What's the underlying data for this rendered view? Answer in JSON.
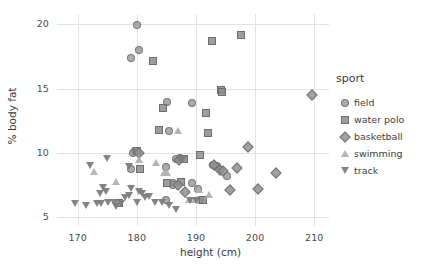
{
  "chart_data": {
    "type": "scatter",
    "title": "",
    "xlabel": "height (cm)",
    "ylabel": "% body fat",
    "xlim": [
      166.5,
      212.5
    ],
    "ylim": [
      4.3,
      20.8
    ],
    "xticks": [
      170,
      180,
      190,
      200,
      210
    ],
    "yticks": [
      5,
      10,
      15,
      20
    ],
    "grid": true,
    "legend_position": "right",
    "legend_title": "sport",
    "series": [
      {
        "name": "field",
        "marker": "circle",
        "color": "#969698",
        "points": [
          [
            180.0,
            19.95
          ],
          [
            180.2,
            18.05
          ],
          [
            179.0,
            17.4
          ],
          [
            185.0,
            14.0
          ],
          [
            189.3,
            13.9
          ],
          [
            185.4,
            11.7
          ],
          [
            179.6,
            10.15
          ],
          [
            179.3,
            10.0
          ],
          [
            186.5,
            9.55
          ],
          [
            187.2,
            9.6
          ],
          [
            192.8,
            9.1
          ],
          [
            193.4,
            9.0
          ],
          [
            184.8,
            8.9
          ],
          [
            178.9,
            8.75
          ],
          [
            195.2,
            8.25
          ],
          [
            186.1,
            7.7
          ],
          [
            189.2,
            7.7
          ],
          [
            186.0,
            7.5
          ],
          [
            190.3,
            7.2
          ],
          [
            190.6,
            6.4
          ],
          [
            184.9,
            6.4
          ]
        ]
      },
      {
        "name": "water polo",
        "marker": "square",
        "color": "#8c8c8e",
        "points": [
          [
            197.5,
            19.2
          ],
          [
            192.6,
            18.7
          ],
          [
            182.6,
            17.2
          ],
          [
            194.2,
            14.9
          ],
          [
            194.4,
            14.75
          ],
          [
            184.3,
            13.5
          ],
          [
            191.6,
            13.1
          ],
          [
            183.6,
            11.8
          ],
          [
            191.9,
            11.6
          ],
          [
            190.6,
            9.9
          ],
          [
            179.9,
            10.2
          ],
          [
            187.9,
            9.55
          ],
          [
            187.4,
            7.75
          ],
          [
            185.0,
            7.7
          ],
          [
            191.1,
            6.35
          ],
          [
            180.4,
            8.75
          ],
          [
            176.9,
            6.15
          ]
        ]
      },
      {
        "name": "basketball",
        "marker": "diamond",
        "color": "#919193",
        "points": [
          [
            209.5,
            14.5
          ],
          [
            198.8,
            10.5
          ],
          [
            203.5,
            8.5
          ],
          [
            196.9,
            8.85
          ],
          [
            193.9,
            8.7
          ],
          [
            194.5,
            8.6
          ],
          [
            192.9,
            9.05
          ],
          [
            195.6,
            7.15
          ],
          [
            200.4,
            7.2
          ],
          [
            188.0,
            6.95
          ],
          [
            187.0,
            9.5
          ],
          [
            180.2,
            10.0
          ],
          [
            186.8,
            7.5
          ]
        ]
      },
      {
        "name": "swimming",
        "marker": "triangle-up",
        "color": "#b0b0b2",
        "points": [
          [
            172.7,
            8.55
          ],
          [
            176.4,
            7.75
          ],
          [
            183.2,
            9.25
          ],
          [
            186.9,
            11.7
          ],
          [
            184.6,
            8.5
          ],
          [
            185.1,
            8.45
          ],
          [
            180.3,
            9.5
          ],
          [
            190.5,
            7.15
          ],
          [
            192.2,
            6.75
          ],
          [
            188.9,
            6.4
          ],
          [
            189.8,
            6.35
          ]
        ]
      },
      {
        "name": "track",
        "marker": "triangle-down",
        "color": "#7c7c7e",
        "points": [
          [
            175.0,
            9.55
          ],
          [
            172.1,
            9.0
          ],
          [
            178.6,
            8.9
          ],
          [
            174.2,
            7.3
          ],
          [
            174.8,
            7.0
          ],
          [
            173.8,
            6.8
          ],
          [
            179.0,
            7.25
          ],
          [
            180.3,
            7.0
          ],
          [
            180.9,
            6.85
          ],
          [
            178.7,
            6.65
          ],
          [
            181.3,
            6.5
          ],
          [
            180.0,
            6.15
          ],
          [
            169.5,
            6.05
          ],
          [
            171.4,
            5.9
          ],
          [
            173.2,
            6.05
          ],
          [
            173.9,
            6.05
          ],
          [
            175.2,
            6.1
          ],
          [
            176.1,
            6.1
          ],
          [
            176.5,
            5.8
          ],
          [
            177.3,
            6.05
          ],
          [
            183.0,
            6.1
          ],
          [
            184.2,
            6.15
          ],
          [
            185.5,
            5.9
          ],
          [
            186.6,
            5.55
          ],
          [
            187.3,
            9.5
          ],
          [
            187.8,
            9.5
          ],
          [
            189.0,
            6.3
          ],
          [
            190.0,
            6.3
          ],
          [
            182.0,
            6.6
          ],
          [
            178.0,
            6.5
          ]
        ]
      }
    ]
  },
  "axes": {
    "x_title": "height (cm)",
    "y_title": "% body fat",
    "x_tick_labels": [
      "170",
      "180",
      "190",
      "200",
      "210"
    ],
    "y_tick_labels": [
      "5",
      "10",
      "15",
      "20"
    ]
  },
  "legend": {
    "title": "sport",
    "entries": [
      {
        "label": "field",
        "marker": "circle-icon"
      },
      {
        "label": "water polo",
        "marker": "square-icon"
      },
      {
        "label": "basketball",
        "marker": "diamond-icon"
      },
      {
        "label": "swimming",
        "marker": "triangle-up-icon"
      },
      {
        "label": "track",
        "marker": "triangle-down-icon"
      }
    ]
  },
  "colors": {
    "field": "#969698",
    "water_polo": "#8c8c8e",
    "basketball": "#919193",
    "swimming": "#b0b0b2",
    "track": "#7c7c7e",
    "grid": "#e2e2e5",
    "text": "#3d3d3d",
    "background": "#ffffff"
  }
}
